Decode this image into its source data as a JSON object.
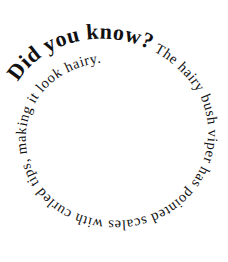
{
  "spiral_text": {
    "heading": "Did you know?",
    "body": " The hairy bush viper has pointed scales with curled tips, making it look hairy."
  },
  "colors": {
    "text": "#111111",
    "background": "#ffffff"
  }
}
